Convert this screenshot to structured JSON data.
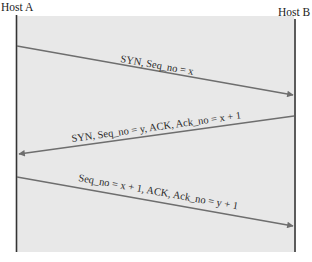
{
  "diagram": {
    "colors": {
      "panel": "#e8e8e8",
      "lifeline": "#333333",
      "arrow": "#6e6e6e",
      "text": "#222222"
    },
    "hosts": [
      {
        "id": "A",
        "label": "Host A"
      },
      {
        "id": "B",
        "label": "Host B"
      }
    ],
    "messages": [
      {
        "from": "A",
        "to": "B",
        "label": "SYN, Seq_no = x"
      },
      {
        "from": "B",
        "to": "A",
        "label": "SYN, Seq_no = y, ACK, Ack_no = x + 1"
      },
      {
        "from": "A",
        "to": "B",
        "label": "Seq_no = x + 1, ACK, Ack_no = y + 1"
      }
    ]
  }
}
